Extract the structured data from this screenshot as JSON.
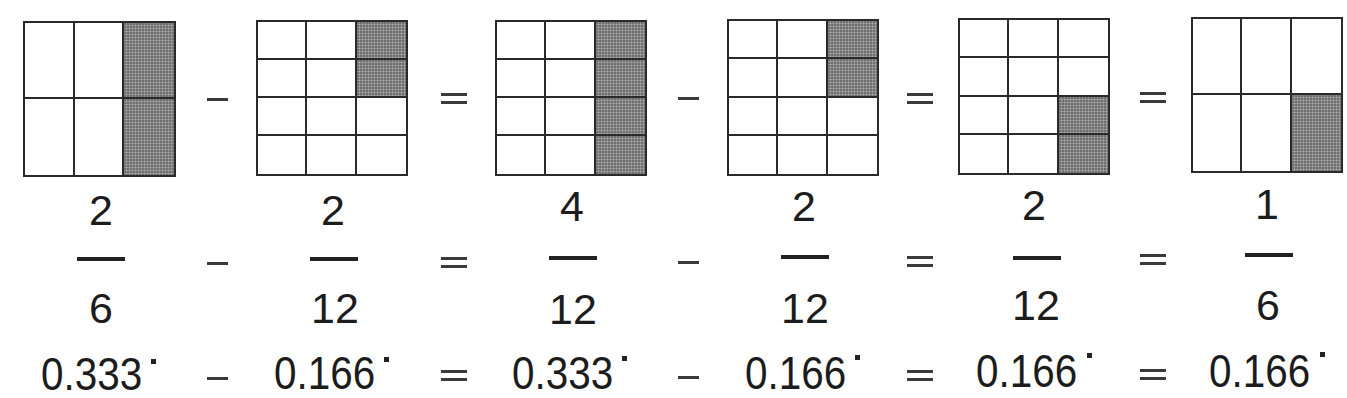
{
  "colors": {
    "line": "#2a2a2a",
    "shade": "#8e8e8e",
    "text": "#1c1c1c",
    "background": "#ffffff"
  },
  "terms": [
    {
      "id": "term-1",
      "grid": {
        "cols": 3,
        "rows": 2,
        "shaded": [
          [
            0,
            2
          ],
          [
            1,
            2
          ]
        ]
      },
      "numerator": "2",
      "denominator": "6",
      "decimal": "0.333",
      "repeating": true
    },
    {
      "id": "term-2",
      "grid": {
        "cols": 3,
        "rows": 4,
        "shaded": [
          [
            0,
            2
          ],
          [
            1,
            2
          ]
        ]
      },
      "numerator": "2",
      "denominator": "12",
      "decimal": "0.166",
      "repeating": true
    },
    {
      "id": "term-3",
      "grid": {
        "cols": 3,
        "rows": 4,
        "shaded": [
          [
            0,
            2
          ],
          [
            1,
            2
          ],
          [
            2,
            2
          ],
          [
            3,
            2
          ]
        ]
      },
      "numerator": "4",
      "denominator": "12",
      "decimal": "0.333",
      "repeating": true
    },
    {
      "id": "term-4",
      "grid": {
        "cols": 3,
        "rows": 4,
        "shaded": [
          [
            0,
            2
          ],
          [
            1,
            2
          ]
        ]
      },
      "numerator": "2",
      "denominator": "12",
      "decimal": "0.166",
      "repeating": true
    },
    {
      "id": "term-5",
      "grid": {
        "cols": 3,
        "rows": 4,
        "shaded": [
          [
            2,
            2
          ],
          [
            3,
            2
          ]
        ]
      },
      "numerator": "2",
      "denominator": "12",
      "decimal": "0.166",
      "repeating": true
    },
    {
      "id": "term-6",
      "grid": {
        "cols": 3,
        "rows": 2,
        "shaded": [
          [
            1,
            2
          ]
        ]
      },
      "numerator": "1",
      "denominator": "6",
      "decimal": "0.166",
      "repeating": true
    }
  ],
  "operators": [
    "minus",
    "equals",
    "minus",
    "equals",
    "equals"
  ],
  "equation": {
    "fractions": "2/6 − 2/12 = 4/12 − 2/12 = 2/12 = 1/6",
    "decimals": "0.333˙ − 0.166˙ = 0.333˙ − 0.166˙ = 0.166˙ = 0.166˙"
  }
}
